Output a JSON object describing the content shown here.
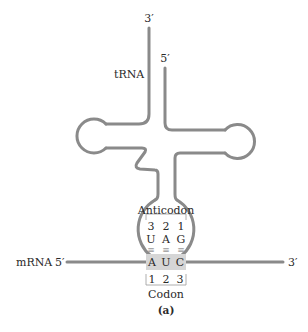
{
  "figure": {
    "caption": "(a)",
    "colors": {
      "strand": "#8a8a8a",
      "codon_highlight": "#d6d6d6",
      "text": "#2a2a2a",
      "bracket": "#9a9a9a"
    },
    "trna": {
      "label": "tRNA",
      "end_3": "3′",
      "end_5": "5′"
    },
    "anticodon": {
      "label": "Anticodon",
      "positions": [
        "3",
        "2",
        "1"
      ],
      "bases": [
        "U",
        "A",
        "G"
      ]
    },
    "pairing": {
      "symbols": [
        "≡",
        "≡",
        "≡"
      ]
    },
    "codon": {
      "label": "Codon",
      "bases": [
        "A",
        "U",
        "C"
      ],
      "positions": [
        "1",
        "2",
        "3"
      ]
    },
    "mrna": {
      "label": "mRNA",
      "end_5": "5′",
      "end_3": "3′"
    }
  }
}
